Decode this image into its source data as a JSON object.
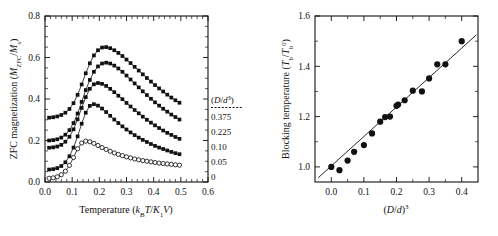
{
  "figure": {
    "background": "#ffffff",
    "ink": "#111111"
  },
  "chart_data": [
    {
      "id": "left-panel",
      "type": "line",
      "title": "",
      "xlabel": "Temperature (kBT/K1V)",
      "xlabel_parts": {
        "lead": "Temperature (",
        "kb": "k",
        "kb_sub": "B",
        "t": "T",
        "slash": "/",
        "k1": "K",
        "k1_sub": "1",
        "v": "V",
        "tail": ")"
      },
      "ylabel": "ZFC magnetization (MZFC/Ms)",
      "ylabel_parts": {
        "lead": "ZFC magnetization (",
        "m": "M",
        "m_sub": "ZFC",
        "slash": "/",
        "m2": "M",
        "m2_sub": "s",
        "tail": ")"
      },
      "xlim": [
        0.0,
        0.6
      ],
      "ylim": [
        0.0,
        0.8
      ],
      "xticks": [
        0.0,
        0.1,
        0.2,
        0.3,
        0.4,
        0.5,
        0.6
      ],
      "xticklabels": [
        "0.0",
        "0.1",
        "0.2",
        "0.3",
        "0.4",
        "0.5",
        "0.6"
      ],
      "yticks": [
        0.0,
        0.2,
        0.4,
        0.6,
        0.8
      ],
      "yticklabels": [
        "0.0",
        "0.2",
        "0.4",
        "0.6",
        "0.8"
      ],
      "xminor_count": 5,
      "yminor_count": 4,
      "grid": false,
      "legend_title": "(D/d3)",
      "legend_title_parts": {
        "open": "(",
        "d": "D",
        "slash": "/",
        "dd": "d",
        "sup": "3",
        "close": ")"
      },
      "legend_position": "right-inside",
      "series": [
        {
          "name": "0.375",
          "marker": "filled-square",
          "x": [
            0.015,
            0.03,
            0.045,
            0.06,
            0.075,
            0.09,
            0.105,
            0.12,
            0.135,
            0.15,
            0.165,
            0.18,
            0.195,
            0.21,
            0.225,
            0.24,
            0.255,
            0.27,
            0.285,
            0.3,
            0.315,
            0.33,
            0.345,
            0.36,
            0.375,
            0.39,
            0.405,
            0.42,
            0.435,
            0.45,
            0.465,
            0.48,
            0.495
          ],
          "y": [
            0.31,
            0.312,
            0.316,
            0.323,
            0.334,
            0.352,
            0.38,
            0.42,
            0.47,
            0.524,
            0.572,
            0.61,
            0.635,
            0.648,
            0.65,
            0.645,
            0.635,
            0.622,
            0.607,
            0.59,
            0.573,
            0.555,
            0.537,
            0.519,
            0.501,
            0.484,
            0.467,
            0.451,
            0.436,
            0.421,
            0.407,
            0.394,
            0.382
          ]
        },
        {
          "name": "0.225",
          "marker": "filled-square",
          "x": [
            0.015,
            0.03,
            0.045,
            0.06,
            0.075,
            0.09,
            0.105,
            0.12,
            0.135,
            0.15,
            0.165,
            0.18,
            0.195,
            0.21,
            0.225,
            0.24,
            0.255,
            0.27,
            0.285,
            0.3,
            0.315,
            0.33,
            0.345,
            0.36,
            0.375,
            0.39,
            0.405,
            0.42,
            0.435,
            0.45,
            0.465,
            0.48,
            0.495
          ],
          "y": [
            0.2,
            0.202,
            0.206,
            0.214,
            0.228,
            0.25,
            0.284,
            0.33,
            0.386,
            0.443,
            0.492,
            0.531,
            0.557,
            0.571,
            0.575,
            0.571,
            0.561,
            0.547,
            0.531,
            0.513,
            0.494,
            0.475,
            0.456,
            0.437,
            0.419,
            0.401,
            0.384,
            0.368,
            0.353,
            0.339,
            0.325,
            0.313,
            0.301
          ]
        },
        {
          "name": "0.10",
          "marker": "filled-square",
          "x": [
            0.015,
            0.03,
            0.045,
            0.06,
            0.075,
            0.09,
            0.105,
            0.12,
            0.135,
            0.15,
            0.165,
            0.18,
            0.195,
            0.21,
            0.225,
            0.24,
            0.255,
            0.27,
            0.285,
            0.3,
            0.315,
            0.33,
            0.345,
            0.36,
            0.375,
            0.39,
            0.405,
            0.42,
            0.435,
            0.45,
            0.465,
            0.48,
            0.495
          ],
          "y": [
            0.165,
            0.167,
            0.171,
            0.179,
            0.194,
            0.218,
            0.254,
            0.302,
            0.357,
            0.409,
            0.449,
            0.471,
            0.477,
            0.473,
            0.463,
            0.449,
            0.433,
            0.416,
            0.399,
            0.381,
            0.364,
            0.347,
            0.331,
            0.315,
            0.3,
            0.286,
            0.273,
            0.26,
            0.248,
            0.237,
            0.227,
            0.217,
            0.208
          ]
        },
        {
          "name": "0.05",
          "marker": "filled-square",
          "x": [
            0.015,
            0.03,
            0.045,
            0.06,
            0.075,
            0.09,
            0.105,
            0.12,
            0.135,
            0.15,
            0.165,
            0.18,
            0.195,
            0.21,
            0.225,
            0.24,
            0.255,
            0.27,
            0.285,
            0.3,
            0.315,
            0.33,
            0.345,
            0.36,
            0.375,
            0.39,
            0.405,
            0.42,
            0.435,
            0.45,
            0.465,
            0.48,
            0.495
          ],
          "y": [
            0.06,
            0.062,
            0.067,
            0.077,
            0.095,
            0.124,
            0.166,
            0.22,
            0.281,
            0.334,
            0.367,
            0.375,
            0.368,
            0.354,
            0.337,
            0.319,
            0.301,
            0.284,
            0.268,
            0.253,
            0.239,
            0.226,
            0.214,
            0.203,
            0.193,
            0.183,
            0.174,
            0.166,
            0.159,
            0.152,
            0.145,
            0.139,
            0.134
          ]
        },
        {
          "name": "0",
          "marker": "open-circle",
          "x": [
            0.015,
            0.03,
            0.045,
            0.06,
            0.075,
            0.09,
            0.105,
            0.12,
            0.135,
            0.15,
            0.165,
            0.18,
            0.195,
            0.21,
            0.225,
            0.24,
            0.255,
            0.27,
            0.285,
            0.3,
            0.315,
            0.33,
            0.345,
            0.36,
            0.375,
            0.39,
            0.405,
            0.42,
            0.435,
            0.45,
            0.465,
            0.48,
            0.495
          ],
          "y": [
            0.018,
            0.02,
            0.025,
            0.035,
            0.052,
            0.08,
            0.118,
            0.16,
            0.188,
            0.197,
            0.194,
            0.186,
            0.176,
            0.166,
            0.157,
            0.148,
            0.14,
            0.133,
            0.127,
            0.121,
            0.116,
            0.111,
            0.107,
            0.103,
            0.1,
            0.097,
            0.094,
            0.091,
            0.089,
            0.087,
            0.085,
            0.083,
            0.081
          ]
        }
      ],
      "legend_entries": [
        "0.375",
        "0.225",
        "0.10",
        "0.05",
        "0"
      ]
    },
    {
      "id": "right-panel",
      "type": "scatter",
      "title": "",
      "xlabel": "(D/d)3",
      "xlabel_parts": {
        "open": "(",
        "d": "D",
        "slash": "/",
        "dd": "d",
        "close": ")",
        "sup": "3"
      },
      "ylabel": "Blocking temperature (Tb/Tb0)",
      "ylabel_parts": {
        "lead": "Blocking temperature (",
        "t": "T",
        "t_sub": "b",
        "slash": "/",
        "t2": "T",
        "t2_sub": "b",
        "t2_sup": "0",
        "tail": ")"
      },
      "xlim": [
        -0.05,
        0.45
      ],
      "ylim": [
        0.94,
        1.6
      ],
      "xticks": [
        0.0,
        0.1,
        0.2,
        0.3,
        0.4
      ],
      "xticklabels": [
        "0.0",
        "0.1",
        "0.2",
        "0.3",
        "0.4"
      ],
      "yticks": [
        1.0,
        1.2,
        1.4,
        1.6
      ],
      "yticklabels": [
        "1.0",
        "1.2",
        "1.4",
        "1.6"
      ],
      "xminor_count": 2,
      "yminor_count": 2,
      "grid": false,
      "marker": "filled-circle",
      "points": [
        {
          "x": 0.0,
          "y": 1.0
        },
        {
          "x": 0.025,
          "y": 0.987
        },
        {
          "x": 0.05,
          "y": 1.025
        },
        {
          "x": 0.07,
          "y": 1.06
        },
        {
          "x": 0.1,
          "y": 1.087
        },
        {
          "x": 0.125,
          "y": 1.133
        },
        {
          "x": 0.15,
          "y": 1.18
        },
        {
          "x": 0.165,
          "y": 1.198
        },
        {
          "x": 0.18,
          "y": 1.2
        },
        {
          "x": 0.2,
          "y": 1.243
        },
        {
          "x": 0.205,
          "y": 1.248
        },
        {
          "x": 0.225,
          "y": 1.265
        },
        {
          "x": 0.25,
          "y": 1.303
        },
        {
          "x": 0.278,
          "y": 1.3
        },
        {
          "x": 0.3,
          "y": 1.352
        },
        {
          "x": 0.325,
          "y": 1.408
        },
        {
          "x": 0.35,
          "y": 1.408
        },
        {
          "x": 0.4,
          "y": 1.5
        }
      ],
      "fit_line": {
        "x0": -0.04,
        "y0": 0.957,
        "x1": 0.445,
        "y1": 1.525,
        "slope": 1.171,
        "intercept": 1.004
      }
    }
  ]
}
